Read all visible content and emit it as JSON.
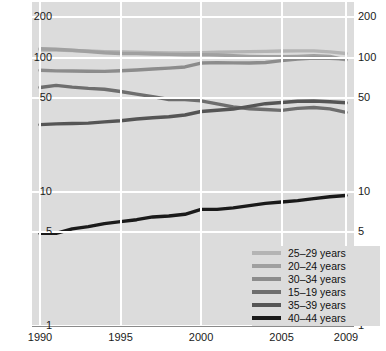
{
  "chart_data": {
    "type": "line",
    "title": "",
    "xlabel": "",
    "ylabel": "",
    "yscale": "log",
    "ylim": [
      1,
      260
    ],
    "xlim": [
      1990,
      2009
    ],
    "grid": true,
    "legend_position": "bottom-right",
    "y_ticks": [
      200,
      100,
      50,
      10,
      5,
      1
    ],
    "y_tick_labels": [
      "200",
      "100",
      "50",
      "10",
      "5",
      "1"
    ],
    "x_ticks": [
      1990,
      1995,
      2000,
      2005,
      2009
    ],
    "x_tick_labels": [
      "1990",
      "1995",
      "2000",
      "2005",
      "2009"
    ],
    "x": [
      1990,
      1991,
      1992,
      1993,
      1994,
      1995,
      1996,
      1997,
      1998,
      1999,
      2000,
      2001,
      2002,
      2003,
      2004,
      2005,
      2006,
      2007,
      2008,
      2009
    ],
    "series": [
      {
        "name": "25–29 years",
        "label": "25–29 years",
        "color": "#b4b4b4",
        "values": [
          114.2,
          113.9,
          113.1,
          112.2,
          111.0,
          110.2,
          109.8,
          109.0,
          108.5,
          108.5,
          109.1,
          109.7,
          110.4,
          111.0,
          111.4,
          112.0,
          112.3,
          112.3,
          110.5,
          107.5
        ]
      },
      {
        "name": "20–24 years",
        "label": "20–24 years",
        "color": "#a0a0a0",
        "values": [
          116.5,
          115.6,
          113.5,
          111.2,
          108.7,
          107.4,
          107.2,
          106.5,
          105.8,
          105.2,
          105.4,
          104.8,
          103.6,
          102.3,
          101.6,
          101.7,
          102.2,
          103.3,
          102.1,
          96.3
        ]
      },
      {
        "name": "30–34 years",
        "label": "30–34 years",
        "color": "#8c8c8c",
        "values": [
          80.6,
          79.7,
          79.5,
          79.2,
          79.1,
          79.8,
          81.0,
          82.3,
          83.6,
          85.3,
          91.2,
          91.9,
          91.5,
          91.2,
          92.0,
          95.1,
          97.7,
          99.3,
          99.1,
          97.5
        ]
      },
      {
        "name": "15–19 years",
        "label": "15–19 years",
        "color": "#6e6e6e",
        "values": [
          59.9,
          62.1,
          60.3,
          59.0,
          58.2,
          56.0,
          53.5,
          51.3,
          48.8,
          48.8,
          47.7,
          45.3,
          43.0,
          41.6,
          41.1,
          40.5,
          41.9,
          42.5,
          41.5,
          39.1
        ]
      },
      {
        "name": "35–39 years",
        "label": "35–39 years",
        "color": "#555555",
        "values": [
          31.7,
          32.1,
          32.3,
          32.5,
          33.2,
          33.9,
          34.9,
          35.7,
          36.3,
          37.4,
          39.7,
          40.6,
          41.4,
          43.4,
          45.4,
          46.3,
          47.3,
          47.5,
          46.9,
          46.1
        ]
      },
      {
        "name": "40–44 years",
        "label": "40–44 years",
        "color": "#1a1a1a",
        "values": [
          4.9,
          4.9,
          5.3,
          5.5,
          5.8,
          6.0,
          6.2,
          6.5,
          6.6,
          6.8,
          7.4,
          7.4,
          7.6,
          7.9,
          8.2,
          8.4,
          8.6,
          8.9,
          9.2,
          9.4
        ]
      }
    ]
  },
  "axis": {
    "left_labels": [
      "200",
      "100",
      "50",
      "10",
      "5",
      "1"
    ],
    "right_labels": [
      "200",
      "100",
      "50",
      "10",
      "5",
      "1"
    ],
    "bottom_labels": [
      "1990",
      "1995",
      "2000",
      "2005",
      "2009"
    ]
  },
  "legend": {
    "items": [
      {
        "label": "25–29 years",
        "color": "#b4b4b4"
      },
      {
        "label": "20–24 years",
        "color": "#a0a0a0"
      },
      {
        "label": "30–34 years",
        "color": "#8c8c8c"
      },
      {
        "label": "15–19 years",
        "color": "#6e6e6e"
      },
      {
        "label": "35–39 years",
        "color": "#555555"
      },
      {
        "label": "40–44 years",
        "color": "#1a1a1a"
      }
    ]
  },
  "colors": {
    "panel_background": "#dcdcdc",
    "gridline": "#ffffff",
    "page_background": "#ffffff",
    "text": "#1a1a1a"
  }
}
